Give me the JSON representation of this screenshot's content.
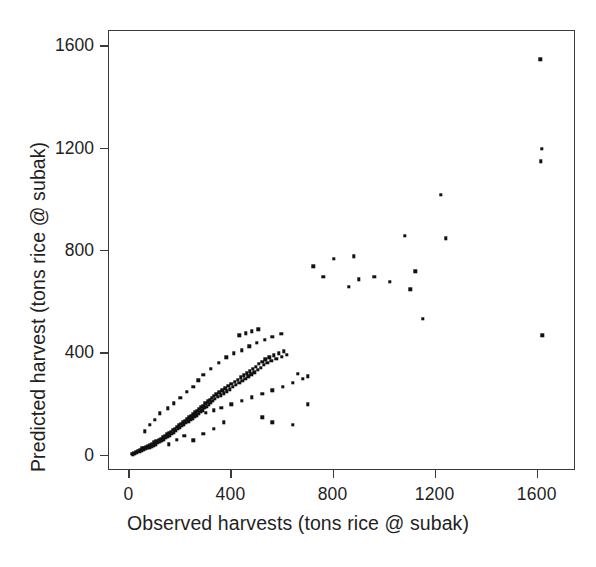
{
  "chart_data": {
    "type": "scatter",
    "title": "",
    "xlabel": "Observed harvests (tons rice @ subak)",
    "ylabel": "Predicted harvest (tons rice @ subak)",
    "xlim": [
      -80,
      1750
    ],
    "ylim": [
      -60,
      1660
    ],
    "xticks": [
      0,
      400,
      800,
      1200,
      1600
    ],
    "yticks": [
      0,
      400,
      800,
      1200,
      1600
    ],
    "xticklabels": [
      "0",
      "400",
      "800",
      "1200",
      "1600"
    ],
    "yticklabels": [
      "0",
      "400",
      "800",
      "1200",
      "1600"
    ],
    "grid": false,
    "legend": null,
    "marker": "square",
    "marker_color": "#111111",
    "marker_size": 3,
    "frame_color": "#3a3a3a",
    "background": "#ffffff",
    "points": [
      [
        10,
        8
      ],
      [
        14,
        5
      ],
      [
        18,
        12
      ],
      [
        22,
        7
      ],
      [
        26,
        15
      ],
      [
        30,
        10
      ],
      [
        34,
        20
      ],
      [
        38,
        14
      ],
      [
        42,
        22
      ],
      [
        46,
        18
      ],
      [
        50,
        28
      ],
      [
        54,
        24
      ],
      [
        58,
        30
      ],
      [
        62,
        26
      ],
      [
        66,
        34
      ],
      [
        70,
        30
      ],
      [
        74,
        38
      ],
      [
        78,
        33
      ],
      [
        82,
        42
      ],
      [
        86,
        36
      ],
      [
        90,
        46
      ],
      [
        94,
        40
      ],
      [
        98,
        52
      ],
      [
        102,
        45
      ],
      [
        106,
        58
      ],
      [
        110,
        50
      ],
      [
        114,
        62
      ],
      [
        118,
        55
      ],
      [
        122,
        66
      ],
      [
        126,
        60
      ],
      [
        130,
        72
      ],
      [
        134,
        64
      ],
      [
        138,
        78
      ],
      [
        142,
        70
      ],
      [
        146,
        84
      ],
      [
        150,
        76
      ],
      [
        154,
        88
      ],
      [
        158,
        80
      ],
      [
        162,
        94
      ],
      [
        166,
        86
      ],
      [
        170,
        100
      ],
      [
        174,
        92
      ],
      [
        178,
        106
      ],
      [
        182,
        98
      ],
      [
        186,
        112
      ],
      [
        190,
        104
      ],
      [
        194,
        118
      ],
      [
        198,
        110
      ],
      [
        202,
        124
      ],
      [
        206,
        116
      ],
      [
        210,
        130
      ],
      [
        214,
        122
      ],
      [
        218,
        136
      ],
      [
        222,
        128
      ],
      [
        226,
        142
      ],
      [
        230,
        134
      ],
      [
        234,
        150
      ],
      [
        238,
        140
      ],
      [
        242,
        156
      ],
      [
        246,
        146
      ],
      [
        250,
        162
      ],
      [
        254,
        152
      ],
      [
        258,
        170
      ],
      [
        262,
        158
      ],
      [
        266,
        176
      ],
      [
        270,
        164
      ],
      [
        274,
        182
      ],
      [
        278,
        172
      ],
      [
        282,
        190
      ],
      [
        286,
        178
      ],
      [
        290,
        196
      ],
      [
        294,
        186
      ],
      [
        298,
        204
      ],
      [
        302,
        192
      ],
      [
        306,
        212
      ],
      [
        310,
        200
      ],
      [
        314,
        218
      ],
      [
        318,
        208
      ],
      [
        322,
        226
      ],
      [
        326,
        214
      ],
      [
        330,
        234
      ],
      [
        334,
        222
      ],
      [
        340,
        240
      ],
      [
        346,
        230
      ],
      [
        352,
        248
      ],
      [
        358,
        236
      ],
      [
        364,
        256
      ],
      [
        370,
        244
      ],
      [
        376,
        264
      ],
      [
        382,
        252
      ],
      [
        388,
        272
      ],
      [
        394,
        260
      ],
      [
        400,
        280
      ],
      [
        406,
        268
      ],
      [
        412,
        288
      ],
      [
        418,
        276
      ],
      [
        424,
        296
      ],
      [
        430,
        284
      ],
      [
        436,
        306
      ],
      [
        442,
        292
      ],
      [
        448,
        314
      ],
      [
        454,
        300
      ],
      [
        460,
        322
      ],
      [
        466,
        310
      ],
      [
        472,
        330
      ],
      [
        478,
        318
      ],
      [
        484,
        340
      ],
      [
        490,
        326
      ],
      [
        496,
        348
      ],
      [
        502,
        336
      ],
      [
        508,
        358
      ],
      [
        514,
        344
      ],
      [
        520,
        366
      ],
      [
        526,
        354
      ],
      [
        532,
        376
      ],
      [
        540,
        362
      ],
      [
        548,
        384
      ],
      [
        556,
        370
      ],
      [
        566,
        392
      ],
      [
        576,
        378
      ],
      [
        586,
        400
      ],
      [
        596,
        386
      ],
      [
        606,
        408
      ],
      [
        616,
        394
      ],
      [
        60,
        95
      ],
      [
        80,
        120
      ],
      [
        100,
        140
      ],
      [
        120,
        165
      ],
      [
        150,
        185
      ],
      [
        175,
        205
      ],
      [
        200,
        225
      ],
      [
        225,
        250
      ],
      [
        250,
        270
      ],
      [
        270,
        295
      ],
      [
        290,
        315
      ],
      [
        320,
        340
      ],
      [
        350,
        362
      ],
      [
        380,
        385
      ],
      [
        410,
        400
      ],
      [
        440,
        412
      ],
      [
        470,
        428
      ],
      [
        500,
        440
      ],
      [
        530,
        452
      ],
      [
        560,
        464
      ],
      [
        595,
        476
      ],
      [
        430,
        470
      ],
      [
        455,
        478
      ],
      [
        480,
        486
      ],
      [
        505,
        494
      ],
      [
        300,
        168
      ],
      [
        330,
        178
      ],
      [
        360,
        188
      ],
      [
        400,
        200
      ],
      [
        440,
        214
      ],
      [
        480,
        228
      ],
      [
        520,
        242
      ],
      [
        560,
        256
      ],
      [
        600,
        270
      ],
      [
        640,
        284
      ],
      [
        680,
        300
      ],
      [
        520,
        150
      ],
      [
        560,
        130
      ],
      [
        640,
        120
      ],
      [
        700,
        200
      ],
      [
        660,
        320
      ],
      [
        700,
        310
      ],
      [
        720,
        740
      ],
      [
        760,
        700
      ],
      [
        800,
        770
      ],
      [
        860,
        660
      ],
      [
        900,
        690
      ],
      [
        880,
        780
      ],
      [
        960,
        700
      ],
      [
        1020,
        680
      ],
      [
        1080,
        860
      ],
      [
        1100,
        650
      ],
      [
        1120,
        720
      ],
      [
        1150,
        535
      ],
      [
        1220,
        1020
      ],
      [
        1240,
        850
      ],
      [
        1610,
        1550
      ],
      [
        1615,
        1200
      ],
      [
        1612,
        1150
      ],
      [
        1618,
        470
      ],
      [
        250,
        60
      ],
      [
        290,
        85
      ],
      [
        330,
        105
      ],
      [
        370,
        130
      ],
      [
        155,
        45
      ],
      [
        185,
        62
      ],
      [
        215,
        78
      ]
    ]
  },
  "axis": {
    "x_tick_labels": [
      "0",
      "400",
      "800",
      "1200",
      "1600"
    ],
    "y_tick_labels": [
      "0",
      "400",
      "800",
      "1200",
      "1600"
    ],
    "x_title": "Observed harvests (tons rice @ subak)",
    "y_title": "Predicted harvest (tons rice @ subak)"
  }
}
